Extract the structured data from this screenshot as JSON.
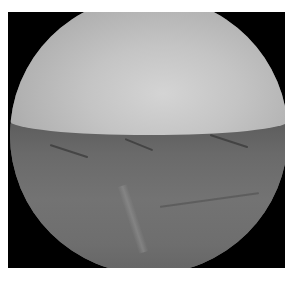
{
  "image": {
    "description": "Grayscale arthroscopic view within circular scope field",
    "colors": {
      "frame": "#000000",
      "background": "#ffffff",
      "upper_surface": "#c4c4c4",
      "lower_tissue": "#6e6e6e"
    }
  }
}
